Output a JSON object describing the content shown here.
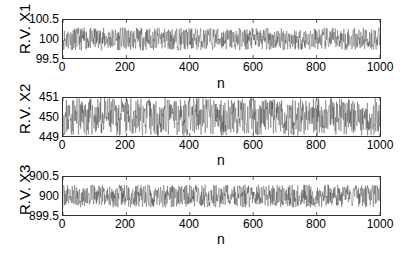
{
  "chart_data": [
    {
      "type": "line",
      "title": "",
      "xlabel": "n",
      "ylabel": "R.V. X1",
      "xlim": [
        0,
        1000
      ],
      "ylim": [
        99.5,
        100.5
      ],
      "xticks": [
        "0",
        "200",
        "400",
        "600",
        "800",
        "1000"
      ],
      "yticks": [
        "100.5",
        "100",
        "99.5"
      ],
      "grid": false,
      "series": [
        {
          "name": "X1",
          "mean": 100,
          "spread": 0.3,
          "n_points": 1000,
          "seed": 11
        }
      ]
    },
    {
      "type": "line",
      "title": "",
      "xlabel": "n",
      "ylabel": "R.V. X2",
      "xlim": [
        0,
        1000
      ],
      "ylim": [
        449,
        451
      ],
      "xticks": [
        "0",
        "200",
        "400",
        "600",
        "800",
        "1000"
      ],
      "yticks": [
        "451",
        "450",
        "449"
      ],
      "grid": false,
      "series": [
        {
          "name": "X2",
          "mean": 450,
          "spread": 1.0,
          "n_points": 1000,
          "seed": 23
        }
      ]
    },
    {
      "type": "line",
      "title": "",
      "xlabel": "n",
      "ylabel": "R.V. X3",
      "xlim": [
        0,
        1000
      ],
      "ylim": [
        899.5,
        900.5
      ],
      "xticks": [
        "0",
        "200",
        "400",
        "600",
        "800",
        "1000"
      ],
      "yticks": [
        "900.5",
        "900",
        "899.5"
      ],
      "grid": false,
      "series": [
        {
          "name": "X3",
          "mean": 900,
          "spread": 0.3,
          "n_points": 1000,
          "seed": 37
        }
      ]
    }
  ],
  "style": {
    "line_color": "#2a2a2a",
    "axis_color": "#333333"
  }
}
